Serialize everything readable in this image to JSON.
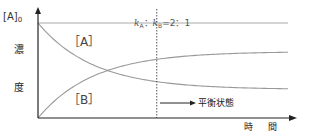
{
  "chart_data": {
    "type": "line",
    "title": "",
    "xlabel": "時 間",
    "ylabel_chars": [
      "濃",
      "度"
    ],
    "y_initial_label": {
      "base": "[A]",
      "sub": "0"
    },
    "x_range": [
      0,
      10
    ],
    "y_range": [
      0,
      1
    ],
    "grid": false,
    "series": [
      {
        "name": "[A]",
        "label": "［A］",
        "initial": 1.0,
        "equilibrium": 0.3,
        "rate": 0.45,
        "color": "#999999"
      },
      {
        "name": "[B]",
        "label": "［B］",
        "initial": 0.0,
        "equilibrium": 0.7,
        "rate": 0.45,
        "color": "#999999"
      }
    ],
    "reference_line": {
      "name": "[A]0",
      "value": 1.0,
      "color": "#aaaaaa"
    },
    "equilibrium_marker": {
      "x": 4.75,
      "ratio_label": {
        "k1": "k",
        "sub1": "A",
        "sep": "：",
        "k2": "k",
        "sub2": "B",
        "rhs": "=2：1"
      },
      "arrow_label": "平衡状態"
    }
  }
}
